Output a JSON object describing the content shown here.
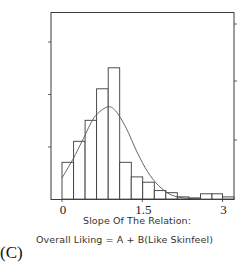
{
  "panel_label": "(C)",
  "caption": {
    "line1": "Slope Of The Relation:",
    "line2": "Overall Liking = A + B(Like Skinfeel)"
  },
  "chart_data": {
    "type": "bar",
    "subtype": "histogram_with_fitted_curve",
    "title": "",
    "xlabel": "Slope Of The Relation: Overall Liking = A + B(Like Skinfeel)",
    "ylabel": "",
    "xlim": [
      0,
      3
    ],
    "x_ticks": [
      0,
      1.5,
      3
    ],
    "x_tick_labels": [
      "0",
      "1.5",
      "3"
    ],
    "y_tick_count_left": 3,
    "y_tick_count_right": 3,
    "y_tick_labels": [],
    "grid": false,
    "legend": null,
    "bin_width": 0.2157,
    "bin_edges": [
      0,
      0.216,
      0.431,
      0.647,
      0.863,
      1.078,
      1.294,
      1.509,
      1.725,
      1.941,
      2.156,
      2.372,
      2.588,
      2.803,
      3.0
    ],
    "values": [
      7,
      11,
      15,
      21,
      25,
      7,
      4.2,
      3.2,
      1.6,
      1.2,
      0.4,
      0.2,
      1.0,
      1.0,
      0.4
    ],
    "value_units": "relative frequency (approx, unlabeled axis)",
    "fitted_curve": {
      "type": "smooth density (skewed normal-like)",
      "peak_x": 0.84,
      "peak_value": 17.5,
      "points": [
        [
          0,
          4
        ],
        [
          0.2,
          7.5
        ],
        [
          0.4,
          11.5
        ],
        [
          0.6,
          15.5
        ],
        [
          0.84,
          17.5
        ],
        [
          1.0,
          16.8
        ],
        [
          1.2,
          13.5
        ],
        [
          1.4,
          9.0
        ],
        [
          1.6,
          5.2
        ],
        [
          1.8,
          2.6
        ],
        [
          2.0,
          1.0
        ],
        [
          2.2,
          0.3
        ],
        [
          2.4,
          0.1
        ],
        [
          2.6,
          0.0
        ]
      ]
    }
  },
  "colors": {
    "axis": "#3a3a3a",
    "bar_stroke": "#3a3a3a",
    "bar_fill": "#ffffff",
    "curve": "#555555"
  }
}
